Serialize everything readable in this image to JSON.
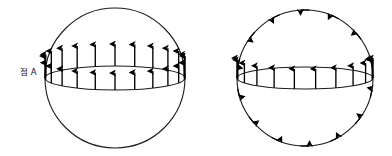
{
  "figure": {
    "background_color": "#ffffff",
    "stroke_color": "#1a1a1a",
    "arrow_color": "#000000",
    "width": 392,
    "height": 156
  },
  "panels": [
    {
      "id": "left",
      "label": "점 A",
      "label_point": "A",
      "sphere": {
        "cx": 115,
        "cy": 78,
        "r": 70
      },
      "equator": {
        "cx": 115,
        "cy": 78,
        "rx": 70,
        "ry": 12
      },
      "description": "sphere with equatorial ellipse and two rows of outward radial arrows",
      "arrow_rows": [
        {
          "name": "back-row",
          "count": 11,
          "direction": "up",
          "length": 22
        },
        {
          "name": "front-row",
          "count": 11,
          "direction": "up",
          "length": 17
        }
      ],
      "circumference_arrows": {
        "count": 0,
        "direction": "none"
      }
    },
    {
      "id": "right",
      "label": "점 A",
      "label_point": "A",
      "sphere": {
        "cx": 109,
        "cy": 78,
        "r": 68
      },
      "equator": {
        "cx": 109,
        "cy": 78,
        "rx": 68,
        "ry": 11
      },
      "description": "sphere with equatorial ellipse arrows plus tangential arrows around the great circle",
      "arrow_rows": [
        {
          "name": "equator-row",
          "count": 10,
          "direction": "up",
          "length": 20
        }
      ],
      "circumference_arrows": {
        "count": 14,
        "direction": "counterclockwise",
        "length": 9
      }
    }
  ]
}
